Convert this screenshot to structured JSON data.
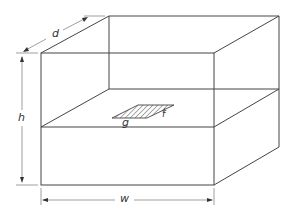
{
  "diagram": {
    "type": "isometric-box-with-slit",
    "labels": {
      "depth": "d",
      "height": "h",
      "width": "w",
      "slit_length": "g",
      "slit_width": "f"
    },
    "colors": {
      "line": "#444444",
      "dimension_line": "#777777",
      "background": "#ffffff"
    }
  }
}
